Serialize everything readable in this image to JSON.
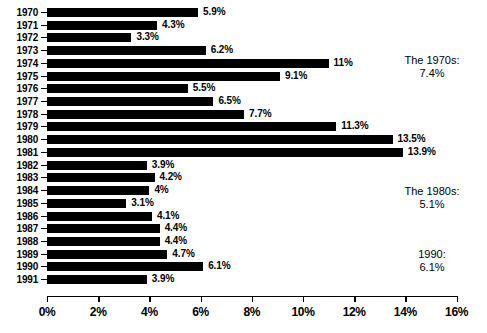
{
  "chart_data": {
    "type": "bar",
    "orientation": "horizontal",
    "title": "",
    "xlabel": "",
    "ylabel": "",
    "xlim": [
      0,
      16
    ],
    "grid": false,
    "legend": null,
    "categories": [
      "1970",
      "1971",
      "1972",
      "1973",
      "1974",
      "1975",
      "1976",
      "1977",
      "1978",
      "1979",
      "1980",
      "1981",
      "1982",
      "1983",
      "1984",
      "1985",
      "1986",
      "1987",
      "1988",
      "1989",
      "1990",
      "1991"
    ],
    "values": [
      5.9,
      4.3,
      3.3,
      6.2,
      11,
      9.1,
      5.5,
      6.5,
      7.7,
      11.3,
      13.5,
      13.9,
      3.9,
      4.2,
      4,
      3.1,
      4.1,
      4.4,
      4.4,
      4.7,
      6.1,
      3.9
    ],
    "data_labels": [
      "5.9%",
      "4.3%",
      "3.3%",
      "6.2%",
      "11%",
      "9.1%",
      "5.5%",
      "6.5%",
      "7.7%",
      "11.3%",
      "13.5%",
      "13.9%",
      "3.9%",
      "4.2%",
      "4%",
      "3.1%",
      "4.1%",
      "4.4%",
      "4.4%",
      "4.7%",
      "6.1%",
      "3.9%"
    ],
    "xticks": [
      0,
      2,
      4,
      6,
      8,
      10,
      12,
      14,
      16
    ],
    "xtick_labels": [
      "0%",
      "2%",
      "4%",
      "6%",
      "8%",
      "10%",
      "12%",
      "14%",
      "16%"
    ],
    "annotations": [
      {
        "id": "decade-1970s",
        "line1": "The 1970s:",
        "line2": "7.4%",
        "value": 7.4
      },
      {
        "id": "decade-1980s",
        "line1": "The 1980s:",
        "line2": "5.1%",
        "value": 5.1
      },
      {
        "id": "year-1990",
        "line1": "1990:",
        "line2": "6.1%",
        "value": 6.1
      }
    ],
    "colors": {
      "bar": "#000000",
      "background": "#ffffff",
      "axis": "#000000",
      "text": "#000000"
    }
  }
}
